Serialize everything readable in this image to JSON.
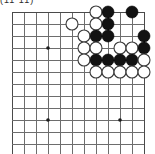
{
  "figure": {
    "caption_fragment": "(11 11)",
    "type": "go-board-diagram"
  },
  "board": {
    "grid_origin_x": 12,
    "grid_origin_y": 12,
    "grid_step": 12,
    "columns": 12,
    "rows": 12,
    "line_color": "#6d6d6d",
    "edge_color": "#4a4a4a",
    "black_color": "#121212",
    "white_color": "#ffffff",
    "stone_radius": 6,
    "hoshi_radius": 1.8,
    "hoshi_points": [
      {
        "col": 3,
        "row": 3
      },
      {
        "col": 3,
        "row": 9
      },
      {
        "col": 9,
        "row": 9
      }
    ]
  },
  "chart_data": {
    "type": "table",
    "xlabel": "column index (0 = left edge line)",
    "ylabel": "row index (0 = top edge line)",
    "legend": [
      "black stone",
      "white stone"
    ],
    "grid": true,
    "stones": [
      {
        "col": 7,
        "row": 0,
        "color": "white"
      },
      {
        "col": 8,
        "row": 0,
        "color": "black"
      },
      {
        "col": 10,
        "row": 0,
        "color": "black"
      },
      {
        "col": 5,
        "row": 1,
        "color": "white"
      },
      {
        "col": 7,
        "row": 1,
        "color": "white"
      },
      {
        "col": 8,
        "row": 1,
        "color": "black"
      },
      {
        "col": 6,
        "row": 2,
        "color": "white"
      },
      {
        "col": 7,
        "row": 2,
        "color": "black"
      },
      {
        "col": 8,
        "row": 2,
        "color": "black"
      },
      {
        "col": 11,
        "row": 2,
        "color": "black"
      },
      {
        "col": 6,
        "row": 3,
        "color": "white"
      },
      {
        "col": 7,
        "row": 3,
        "color": "white"
      },
      {
        "col": 9,
        "row": 3,
        "color": "white"
      },
      {
        "col": 10,
        "row": 3,
        "color": "white"
      },
      {
        "col": 11,
        "row": 3,
        "color": "black"
      },
      {
        "col": 6,
        "row": 4,
        "color": "white"
      },
      {
        "col": 7,
        "row": 4,
        "color": "black"
      },
      {
        "col": 8,
        "row": 4,
        "color": "black"
      },
      {
        "col": 9,
        "row": 4,
        "color": "black"
      },
      {
        "col": 10,
        "row": 4,
        "color": "black"
      },
      {
        "col": 11,
        "row": 4,
        "color": "white"
      },
      {
        "col": 7,
        "row": 5,
        "color": "white"
      },
      {
        "col": 8,
        "row": 5,
        "color": "white"
      },
      {
        "col": 9,
        "row": 5,
        "color": "white"
      },
      {
        "col": 10,
        "row": 5,
        "color": "white"
      },
      {
        "col": 11,
        "row": 5,
        "color": "white"
      }
    ],
    "counts": {
      "black": 11,
      "white": 15,
      "total": 26
    }
  }
}
